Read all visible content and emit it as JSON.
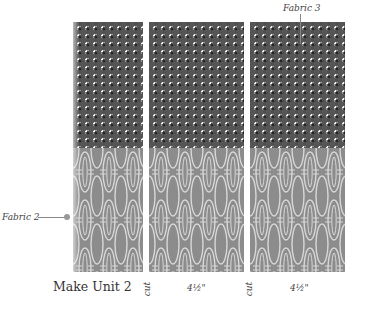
{
  "title": "Make Unit 2",
  "labels": {
    "fabric_top": "Fabric 3",
    "fabric_bottom": "Fabric 2"
  },
  "cuts": [
    {
      "label": "cut"
    },
    {
      "label": "cut"
    }
  ],
  "measurements": [
    {
      "label": "4½\""
    },
    {
      "label": "4½\""
    }
  ],
  "strips": [
    {
      "name": "strip-1",
      "top_fabric": "Fabric 3",
      "bottom_fabric": "Fabric 2"
    },
    {
      "name": "strip-2",
      "top_fabric": "Fabric 3",
      "bottom_fabric": "Fabric 2"
    },
    {
      "name": "strip-3",
      "top_fabric": "Fabric 3",
      "bottom_fabric": "Fabric 2"
    }
  ],
  "colors": {
    "grid_fabric_bg": "#f2f2f2",
    "grid_lines": "#4a4a4a",
    "print_fabric_bg": "#8c8c8c",
    "print_motif": "#d8d8d8",
    "text": "#444444"
  }
}
